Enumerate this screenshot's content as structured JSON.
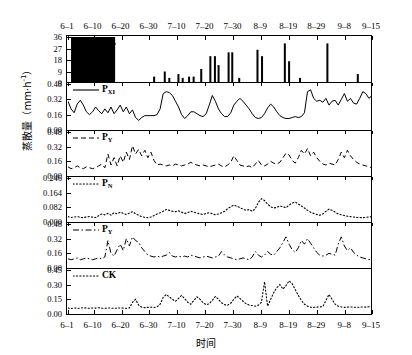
{
  "chart_data": {
    "type": "line",
    "title": "",
    "xlabel": "时间",
    "ylabel": "蒸散量（mm·h⁻¹）",
    "ylabel_main": "蒸散量（mm·h",
    "ylabel_exp": "-1",
    "ylabel_tail": "）",
    "x_tick_labels": [
      "6–1",
      "6–10",
      "6–20",
      "6–30",
      "7–10",
      "7–20",
      "7–30",
      "8–9",
      "8–19",
      "8–29",
      "9–8",
      "9–15"
    ],
    "x_tick_positions": [
      0,
      8.4,
      17.6,
      26.8,
      36.0,
      45.2,
      54.4,
      63.6,
      72.8,
      82.0,
      91.2,
      100
    ],
    "grid": false,
    "legend_position": "inside-top-left",
    "panels": [
      {
        "id": "panel-precip",
        "label": "P",
        "label_sub": "",
        "series_type": "bar",
        "line_style": "solid",
        "marker": "filled-rect-swatch",
        "y_ticks": [
          "36",
          "27",
          "18",
          "9",
          "0"
        ],
        "y_values": [
          36,
          27,
          18,
          9,
          0
        ],
        "ylim": [
          0,
          36
        ],
        "values": [
          0,
          0,
          0,
          0,
          0,
          0,
          0,
          0,
          0,
          0,
          0,
          0,
          0,
          0,
          0,
          0,
          0,
          0,
          0,
          0,
          0,
          0,
          0,
          0,
          0,
          4,
          0,
          0,
          8,
          0,
          0,
          0,
          6,
          5,
          0,
          0,
          5,
          4,
          0,
          0,
          9,
          0,
          0,
          0,
          0,
          21,
          0,
          21,
          0,
          0,
          0,
          0,
          24,
          24,
          0,
          4,
          0,
          0,
          0,
          0,
          0,
          0,
          0,
          0,
          26,
          21,
          0,
          0,
          0,
          0,
          0,
          0,
          0,
          0,
          0,
          0,
          31,
          17,
          0,
          0,
          0,
          0,
          4,
          0,
          0,
          0,
          0,
          0,
          0,
          0,
          31,
          0,
          0,
          0,
          0,
          0,
          0,
          0,
          0,
          7,
          0,
          0,
          0,
          0,
          0,
          0,
          0,
          0,
          0,
          0,
          0,
          0,
          0,
          0,
          0,
          0,
          0,
          0,
          0,
          0
        ],
        "bars": [
          {
            "x": 1.0,
            "h": 36,
            "w": 14.5,
            "swatch": true
          },
          {
            "x": 28.0,
            "h": 5
          },
          {
            "x": 31.5,
            "h": 9
          },
          {
            "x": 33.0,
            "h": 4
          },
          {
            "x": 36.0,
            "h": 7
          },
          {
            "x": 37.4,
            "h": 4
          },
          {
            "x": 39.5,
            "h": 5
          },
          {
            "x": 41.0,
            "h": 5
          },
          {
            "x": 43.5,
            "h": 11
          },
          {
            "x": 46.5,
            "h": 21
          },
          {
            "x": 48.0,
            "h": 21
          },
          {
            "x": 49.2,
            "h": 14
          },
          {
            "x": 52.5,
            "h": 24
          },
          {
            "x": 53.7,
            "h": 24
          },
          {
            "x": 56.0,
            "h": 4
          },
          {
            "x": 62.0,
            "h": 26
          },
          {
            "x": 63.5,
            "h": 21
          },
          {
            "x": 71.0,
            "h": 31
          },
          {
            "x": 72.4,
            "h": 17
          },
          {
            "x": 76.0,
            "h": 4
          },
          {
            "x": 85.0,
            "h": 31
          },
          {
            "x": 95.0,
            "h": 7
          }
        ]
      },
      {
        "id": "panel-pxi",
        "label": "P",
        "label_sub": "XI",
        "series_type": "line",
        "line_style": "solid",
        "y_ticks": [
          "0.48",
          "0.32",
          "0.16",
          "0.00"
        ],
        "y_values": [
          0.48,
          0.32,
          0.16,
          0.0
        ],
        "ylim": [
          0,
          0.48
        ],
        "values": [
          0.3,
          0.22,
          0.18,
          0.27,
          0.31,
          0.26,
          0.19,
          0.16,
          0.19,
          0.24,
          0.2,
          0.17,
          0.22,
          0.18,
          0.24,
          0.17,
          0.21,
          0.26,
          0.19,
          0.24,
          0.17,
          0.21,
          0.13,
          0.1,
          0.13,
          0.15,
          0.15,
          0.15,
          0.15,
          0.16,
          0.22,
          0.38,
          0.4,
          0.39,
          0.36,
          0.3,
          0.24,
          0.16,
          0.12,
          0.15,
          0.19,
          0.19,
          0.17,
          0.15,
          0.14,
          0.17,
          0.26,
          0.36,
          0.3,
          0.22,
          0.17,
          0.14,
          0.14,
          0.18,
          0.26,
          0.3,
          0.33,
          0.3,
          0.26,
          0.22,
          0.17,
          0.13,
          0.12,
          0.13,
          0.17,
          0.23,
          0.27,
          0.24,
          0.19,
          0.15,
          0.13,
          0.12,
          0.12,
          0.13,
          0.14,
          0.13,
          0.14,
          0.18,
          0.4,
          0.42,
          0.33,
          0.3,
          0.31,
          0.29,
          0.33,
          0.26,
          0.3,
          0.31,
          0.26,
          0.32,
          0.38,
          0.3,
          0.33,
          0.28,
          0.27,
          0.33,
          0.4,
          0.38,
          0.33,
          0.36
        ]
      },
      {
        "id": "panel-py1",
        "label": "P",
        "label_sub": "Y",
        "series_type": "line",
        "line_style": "dashed",
        "y_ticks": [
          "0.48",
          "0.32",
          "0.16",
          "0.00"
        ],
        "y_values": [
          0.48,
          0.32,
          0.16,
          0.0
        ],
        "ylim": [
          0,
          0.48
        ],
        "values": [
          0.1,
          0.08,
          0.09,
          0.11,
          0.09,
          0.08,
          0.1,
          0.09,
          0.08,
          0.09,
          0.11,
          0.13,
          0.09,
          0.24,
          0.12,
          0.2,
          0.11,
          0.22,
          0.15,
          0.26,
          0.18,
          0.33,
          0.24,
          0.29,
          0.22,
          0.28,
          0.2,
          0.26,
          0.17,
          0.12,
          0.13,
          0.12,
          0.11,
          0.12,
          0.11,
          0.13,
          0.12,
          0.11,
          0.12,
          0.13,
          0.15,
          0.13,
          0.12,
          0.11,
          0.12,
          0.11,
          0.1,
          0.11,
          0.12,
          0.13,
          0.11,
          0.1,
          0.12,
          0.15,
          0.22,
          0.17,
          0.12,
          0.11,
          0.1,
          0.11,
          0.09,
          0.13,
          0.17,
          0.12,
          0.11,
          0.13,
          0.16,
          0.14,
          0.13,
          0.15,
          0.2,
          0.25,
          0.23,
          0.17,
          0.14,
          0.2,
          0.28,
          0.24,
          0.3,
          0.22,
          0.26,
          0.2,
          0.16,
          0.13,
          0.12,
          0.14,
          0.13,
          0.12,
          0.18,
          0.26,
          0.2,
          0.28,
          0.22,
          0.18,
          0.15,
          0.13,
          0.12,
          0.11,
          0.1,
          0.09
        ]
      },
      {
        "id": "panel-pn",
        "label": "P",
        "label_sub": "N",
        "series_type": "line",
        "line_style": "dotted",
        "y_ticks": [
          "0.246",
          "0.164",
          "0.082",
          "0.000"
        ],
        "y_values": [
          0.246,
          0.164,
          0.082,
          0.0
        ],
        "ylim": [
          0,
          0.246
        ],
        "values": [
          0.03,
          0.025,
          0.028,
          0.03,
          0.026,
          0.024,
          0.028,
          0.03,
          0.027,
          0.025,
          0.035,
          0.045,
          0.04,
          0.048,
          0.038,
          0.052,
          0.046,
          0.055,
          0.048,
          0.042,
          0.05,
          0.058,
          0.046,
          0.038,
          0.03,
          0.026,
          0.024,
          0.028,
          0.036,
          0.045,
          0.052,
          0.06,
          0.07,
          0.065,
          0.06,
          0.058,
          0.062,
          0.055,
          0.048,
          0.052,
          0.06,
          0.055,
          0.05,
          0.045,
          0.042,
          0.048,
          0.052,
          0.046,
          0.04,
          0.045,
          0.052,
          0.06,
          0.075,
          0.085,
          0.095,
          0.088,
          0.08,
          0.072,
          0.065,
          0.07,
          0.06,
          0.075,
          0.11,
          0.13,
          0.12,
          0.1,
          0.085,
          0.078,
          0.082,
          0.09,
          0.085,
          0.08,
          0.095,
          0.105,
          0.112,
          0.1,
          0.09,
          0.078,
          0.065,
          0.055,
          0.048,
          0.042,
          0.038,
          0.045,
          0.06,
          0.072,
          0.065,
          0.055,
          0.045,
          0.04,
          0.036,
          0.032,
          0.03,
          0.028,
          0.026,
          0.025,
          0.024,
          0.026,
          0.028,
          0.03
        ]
      },
      {
        "id": "panel-py2",
        "label": "P",
        "label_sub": "Y",
        "series_type": "line",
        "line_style": "dashdot",
        "y_ticks": [
          "0.48",
          "0.32",
          "0.16",
          "0.00"
        ],
        "y_values": [
          0.48,
          0.32,
          0.16,
          0.0
        ],
        "ylim": [
          0,
          0.48
        ],
        "values": [
          0.1,
          0.09,
          0.1,
          0.11,
          0.09,
          0.1,
          0.11,
          0.1,
          0.09,
          0.1,
          0.11,
          0.1,
          0.12,
          0.3,
          0.16,
          0.13,
          0.2,
          0.26,
          0.19,
          0.32,
          0.24,
          0.34,
          0.3,
          0.28,
          0.22,
          0.18,
          0.14,
          0.13,
          0.12,
          0.13,
          0.12,
          0.13,
          0.14,
          0.17,
          0.13,
          0.12,
          0.13,
          0.12,
          0.13,
          0.12,
          0.14,
          0.13,
          0.12,
          0.11,
          0.12,
          0.13,
          0.12,
          0.11,
          0.12,
          0.13,
          0.18,
          0.14,
          0.12,
          0.11,
          0.1,
          0.09,
          0.1,
          0.11,
          0.1,
          0.09,
          0.12,
          0.18,
          0.14,
          0.12,
          0.14,
          0.18,
          0.15,
          0.14,
          0.18,
          0.22,
          0.28,
          0.34,
          0.26,
          0.2,
          0.17,
          0.22,
          0.3,
          0.26,
          0.32,
          0.27,
          0.22,
          0.17,
          0.14,
          0.13,
          0.14,
          0.16,
          0.15,
          0.14,
          0.26,
          0.34,
          0.24,
          0.19,
          0.22,
          0.17,
          0.14,
          0.12,
          0.11,
          0.1,
          0.09,
          0.1
        ]
      },
      {
        "id": "panel-ck",
        "label": "CK",
        "label_sub": "",
        "series_type": "line",
        "line_style": "dotted",
        "y_ticks": [
          "0.45",
          "0.30",
          "0.15",
          "0.00"
        ],
        "y_values": [
          0.45,
          0.3,
          0.15,
          0.0
        ],
        "ylim": [
          0,
          0.45
        ],
        "values": [
          0.06,
          0.055,
          0.062,
          0.058,
          0.06,
          0.065,
          0.06,
          0.058,
          0.062,
          0.06,
          0.064,
          0.06,
          0.058,
          0.062,
          0.06,
          0.058,
          0.06,
          0.062,
          0.06,
          0.058,
          0.062,
          0.12,
          0.15,
          0.09,
          0.07,
          0.065,
          0.068,
          0.07,
          0.066,
          0.072,
          0.1,
          0.17,
          0.2,
          0.175,
          0.15,
          0.13,
          0.16,
          0.19,
          0.155,
          0.12,
          0.1,
          0.14,
          0.175,
          0.15,
          0.115,
          0.095,
          0.105,
          0.14,
          0.18,
          0.15,
          0.115,
          0.095,
          0.09,
          0.11,
          0.15,
          0.185,
          0.16,
          0.13,
          0.105,
          0.09,
          0.085,
          0.08,
          0.09,
          0.12,
          0.33,
          0.08,
          0.15,
          0.22,
          0.27,
          0.3,
          0.255,
          0.29,
          0.34,
          0.31,
          0.25,
          0.19,
          0.14,
          0.1,
          0.08,
          0.07,
          0.068,
          0.07,
          0.072,
          0.075,
          0.14,
          0.2,
          0.15,
          0.1,
          0.08,
          0.072,
          0.068,
          0.07,
          0.072,
          0.07,
          0.068,
          0.07,
          0.072,
          0.07,
          0.074,
          0.072
        ]
      }
    ]
  }
}
